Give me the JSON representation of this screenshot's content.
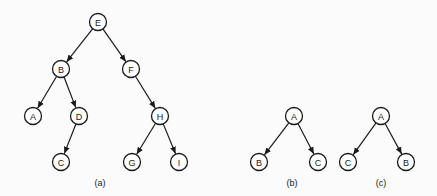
{
  "diagram": {
    "node_radius": 8.5,
    "stroke_color": "#1a1a1a",
    "background": "#fbfbfb",
    "trees": [
      {
        "id": "a",
        "caption": "(a)",
        "caption_pos": [
          100,
          183
        ],
        "nodes": [
          {
            "id": "E",
            "label": "E",
            "x": 98,
            "y": 22
          },
          {
            "id": "B",
            "label": "B",
            "x": 61,
            "y": 69
          },
          {
            "id": "F",
            "label": "F",
            "x": 131,
            "y": 69
          },
          {
            "id": "A",
            "label": "A",
            "x": 33,
            "y": 116
          },
          {
            "id": "D",
            "label": "D",
            "x": 79,
            "y": 116
          },
          {
            "id": "H",
            "label": "H",
            "x": 160,
            "y": 116
          },
          {
            "id": "C",
            "label": "C",
            "x": 61,
            "y": 162
          },
          {
            "id": "G",
            "label": "G",
            "x": 132,
            "y": 162
          },
          {
            "id": "I",
            "label": "I",
            "x": 179,
            "y": 162
          }
        ],
        "edges": [
          [
            "E",
            "B"
          ],
          [
            "E",
            "F"
          ],
          [
            "B",
            "A"
          ],
          [
            "B",
            "D"
          ],
          [
            "D",
            "C"
          ],
          [
            "F",
            "H"
          ],
          [
            "H",
            "G"
          ],
          [
            "H",
            "I"
          ]
        ]
      },
      {
        "id": "b",
        "caption": "(b)",
        "caption_pos": [
          292,
          183
        ],
        "nodes": [
          {
            "id": "A",
            "label": "A",
            "x": 294,
            "y": 116
          },
          {
            "id": "B",
            "label": "B",
            "x": 259,
            "y": 162
          },
          {
            "id": "C",
            "label": "C",
            "x": 318,
            "y": 162
          }
        ],
        "edges": [
          [
            "A",
            "B"
          ],
          [
            "A",
            "C"
          ]
        ]
      },
      {
        "id": "c",
        "caption": "(c)",
        "caption_pos": [
          381,
          183
        ],
        "nodes": [
          {
            "id": "A",
            "label": "A",
            "x": 381,
            "y": 116
          },
          {
            "id": "C",
            "label": "C",
            "x": 348,
            "y": 162
          },
          {
            "id": "B",
            "label": "B",
            "x": 406,
            "y": 162
          }
        ],
        "edges": [
          [
            "A",
            "C"
          ],
          [
            "A",
            "B"
          ]
        ]
      }
    ]
  }
}
